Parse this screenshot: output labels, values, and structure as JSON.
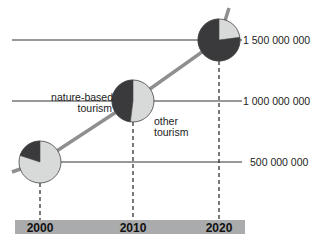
{
  "chart_data": {
    "type": "pie",
    "title": "",
    "xlabel": "",
    "ylabel": "",
    "categories": [
      "2000",
      "2010",
      "2020"
    ],
    "total_tourists": [
      500000000,
      1000000000,
      1500000000
    ],
    "series": [
      {
        "name": "nature-based tourism",
        "share": [
          0.2,
          0.48,
          0.77
        ],
        "color": "#3a3a3c"
      },
      {
        "name": "other tourism",
        "share": [
          0.8,
          0.52,
          0.23
        ],
        "color": "#d8dada"
      }
    ],
    "y_ticks": [
      {
        "value": 500000000,
        "label": "500 000 000"
      },
      {
        "value": 1000000000,
        "label": "1 000 000 000"
      },
      {
        "value": 1500000000,
        "label": "1 500 000 000"
      }
    ],
    "annotations": {
      "nature_label": [
        "nature-based",
        "tourism"
      ],
      "other_label": [
        "other",
        "tourism"
      ]
    },
    "grid": true
  }
}
